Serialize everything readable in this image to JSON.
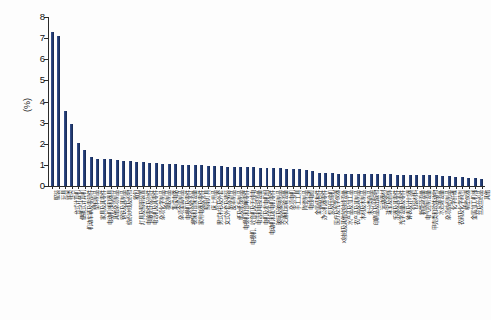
{
  "chart_data": {
    "type": "bar",
    "title": "",
    "xlabel": "",
    "ylabel": "(%)",
    "ylim": [
      0,
      8
    ],
    "ytick_labels": [
      "0",
      "1",
      "2",
      "3",
      "4",
      "5",
      "6",
      "7",
      "8"
    ],
    "ytick_values": [
      0,
      1,
      2,
      3,
      4,
      5,
      6,
      7,
      8
    ],
    "grid": false,
    "legend": null,
    "bar_color": "#27417a",
    "categories": [
      "服装",
      "玩具",
      "鞋类",
      "台式计算机",
      "便携式计算机",
      "机动车辆及零部件",
      "塑料制品",
      "家具及其零件",
      "电动机械和器具",
      "其他杂项制品",
      "钢铁及其制品",
      "纺织纱线及织物",
      "箱包",
      "灯具及照明装置",
      "电脑零件及附件",
      "电话机及其零件",
      "杂项化学制品",
      "橡胶制品",
      "集成电路",
      "杂项金属制品",
      "电视机及零件",
      "视频和音频设备",
      "家用电器及零件",
      "照明灯具",
      "床上用品",
      "男式衬衫及外套",
      "女式外套及裙装",
      "皮革制品",
      "纸及纸板制品",
      "电视机和音响零件",
      "电视机、收音机及无线电",
      "电话和电报设备",
      "电机及发电机组",
      "电动机和发电机零件",
      "玻璃及玻璃制品",
      "交通和运输设备",
      "杂项电机",
      "手工工具",
      "陶瓷制品",
      "电线电缆",
      "金属结构件",
      "办公机器零件",
      "泵及压缩机",
      "医疗及光学仪器",
      "X射线及其他放射线设备",
      "水产品及加工品",
      "农产品及其制品",
      "木材及木制品",
      "未分类商品",
      "印刷品及出版物",
      "运动器材",
      "珠宝及首饰",
      "乐器及其零件",
      "光学设备及零件",
      "钟表及计时器",
      "包装材料",
      "新能源设备",
      "电气控制设备",
      "甲壳类和软体动物",
      "水处理设备",
      "杂项纺织制品",
      "化学纤维",
      "农药及化学药剂",
      "精密仪器",
      "金属加工机械",
      "丝及丝织品",
      "其他"
    ],
    "values": [
      7.3,
      7.1,
      3.55,
      2.95,
      2.05,
      1.7,
      1.35,
      1.3,
      1.28,
      1.28,
      1.22,
      1.2,
      1.18,
      1.15,
      1.12,
      1.1,
      1.08,
      1.05,
      1.05,
      1.02,
      1.0,
      1.0,
      0.98,
      0.98,
      0.95,
      0.95,
      0.93,
      0.92,
      0.9,
      0.9,
      0.88,
      0.88,
      0.86,
      0.85,
      0.85,
      0.83,
      0.82,
      0.8,
      0.8,
      0.78,
      0.72,
      0.62,
      0.6,
      0.6,
      0.58,
      0.58,
      0.58,
      0.57,
      0.56,
      0.56,
      0.56,
      0.55,
      0.55,
      0.54,
      0.54,
      0.53,
      0.52,
      0.52,
      0.5,
      0.5,
      0.48,
      0.46,
      0.44,
      0.42,
      0.4,
      0.38,
      0.35
    ]
  }
}
